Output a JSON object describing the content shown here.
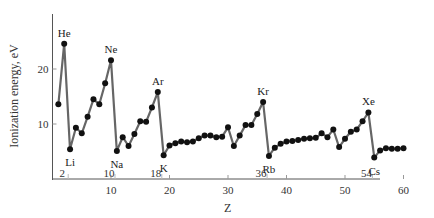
{
  "chart_data": {
    "type": "line",
    "title": "",
    "xlabel": "Z",
    "ylabel": "Ionization energy, eV",
    "xlim": [
      0,
      62
    ],
    "ylim": [
      0,
      30
    ],
    "xticks": [
      10,
      20,
      30,
      40,
      50,
      60
    ],
    "yticks": [
      10,
      20
    ],
    "grid": false,
    "series": [
      {
        "name": "First ionization energy",
        "x": [
          1,
          2,
          3,
          4,
          5,
          6,
          7,
          8,
          9,
          10,
          11,
          12,
          13,
          14,
          15,
          16,
          17,
          18,
          19,
          20,
          21,
          22,
          23,
          24,
          25,
          26,
          27,
          28,
          29,
          30,
          31,
          32,
          33,
          34,
          35,
          36,
          37,
          38,
          39,
          40,
          41,
          42,
          43,
          44,
          45,
          46,
          47,
          48,
          49,
          50,
          51,
          52,
          53,
          54,
          55,
          56,
          57,
          58,
          59,
          60
        ],
        "values": [
          13.6,
          24.6,
          5.4,
          9.3,
          8.3,
          11.3,
          14.5,
          13.6,
          17.4,
          21.6,
          5.1,
          7.6,
          6.0,
          8.2,
          10.5,
          10.4,
          13.0,
          15.8,
          4.3,
          6.1,
          6.5,
          6.8,
          6.7,
          6.8,
          7.4,
          7.9,
          7.9,
          7.6,
          7.7,
          9.4,
          6.0,
          7.9,
          9.8,
          9.8,
          11.8,
          14.0,
          4.2,
          5.7,
          6.4,
          6.8,
          6.9,
          7.1,
          7.3,
          7.4,
          7.5,
          8.3,
          7.6,
          9.0,
          5.8,
          7.3,
          8.6,
          9.0,
          10.5,
          12.1,
          3.9,
          5.2,
          5.6,
          5.5,
          5.5,
          5.6
        ]
      }
    ],
    "annotations": [
      {
        "label": "He",
        "z": 2,
        "pos": "above"
      },
      {
        "label": "Ne",
        "z": 10,
        "pos": "above"
      },
      {
        "label": "Ar",
        "z": 18,
        "pos": "above"
      },
      {
        "label": "Kr",
        "z": 36,
        "pos": "above"
      },
      {
        "label": "Xe",
        "z": 54,
        "pos": "above"
      },
      {
        "label": "Li",
        "z": 3,
        "pos": "below"
      },
      {
        "label": "Na",
        "z": 11,
        "pos": "below"
      },
      {
        "label": "K",
        "z": 19,
        "pos": "below"
      },
      {
        "label": "Rb",
        "z": 37,
        "pos": "below"
      },
      {
        "label": "Cs",
        "z": 55,
        "pos": "below"
      }
    ],
    "period_markers": [
      {
        "label": "2",
        "z": 2
      },
      {
        "label": "10",
        "z": 10
      },
      {
        "label": "18",
        "z": 18
      },
      {
        "label": "36",
        "z": 36
      },
      {
        "label": "54",
        "z": 54
      }
    ]
  },
  "labels": {
    "ylabel": "Ionization energy, eV",
    "xlabel": "Z"
  }
}
